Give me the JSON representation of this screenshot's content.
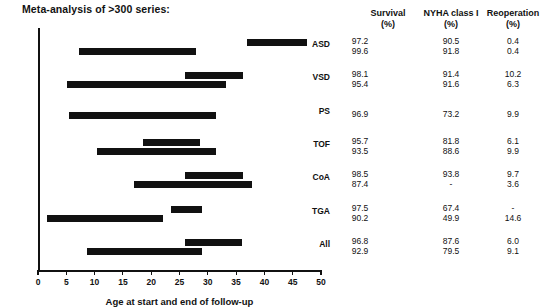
{
  "figure": {
    "title": "Meta-analysis of >300 series:"
  },
  "chart_data": {
    "type": "bar",
    "title": "Meta-analysis of >300 series:",
    "xlabel": "Age at start and end of follow-up",
    "ylabel": "",
    "xlim": [
      0,
      50
    ],
    "xticks": [
      0,
      5,
      10,
      15,
      20,
      25,
      30,
      35,
      40,
      45,
      50
    ],
    "grid": false,
    "legend": null,
    "orientation": "horizontal-range-bars",
    "bar_color": "#111111",
    "categories": [
      "ASD",
      "VSD",
      "PS",
      "TOF",
      "CoA",
      "TGA",
      "All"
    ],
    "groups": [
      {
        "category": "ASD",
        "bars": [
          {
            "start": 37.0,
            "end": 47.5
          },
          {
            "start": 7.2,
            "end": 28.0
          }
        ]
      },
      {
        "category": "VSD",
        "bars": [
          {
            "start": 26.0,
            "end": 36.2
          },
          {
            "start": 5.2,
            "end": 33.2
          }
        ]
      },
      {
        "category": "PS",
        "bars": [
          {
            "start": 5.4,
            "end": 31.5
          }
        ]
      },
      {
        "category": "TOF",
        "bars": [
          {
            "start": 18.6,
            "end": 28.7
          },
          {
            "start": 10.5,
            "end": 31.4
          }
        ]
      },
      {
        "category": "CoA",
        "bars": [
          {
            "start": 26.0,
            "end": 36.3
          },
          {
            "start": 17.0,
            "end": 37.8
          }
        ]
      },
      {
        "category": "TGA",
        "bars": [
          {
            "start": 23.5,
            "end": 29.0
          },
          {
            "start": 1.6,
            "end": 22.0
          }
        ]
      },
      {
        "category": "All",
        "bars": [
          {
            "start": 26.0,
            "end": 36.0
          },
          {
            "start": 8.7,
            "end": 29.0
          }
        ]
      }
    ],
    "table": {
      "columns": [
        "Survival (%)",
        "NYHA class I (%)",
        "Reoperation (%)"
      ],
      "rows": [
        {
          "category": "ASD",
          "survival": [
            "97.2",
            "99.6"
          ],
          "nyha": [
            "90.5",
            "91.8"
          ],
          "reoperation": [
            "0.4",
            "0.4"
          ]
        },
        {
          "category": "VSD",
          "survival": [
            "98.1",
            "95.4"
          ],
          "nyha": [
            "91.4",
            "91.6"
          ],
          "reoperation": [
            "10.2",
            "6.3"
          ]
        },
        {
          "category": "PS",
          "survival": [
            "96.9"
          ],
          "nyha": [
            "73.2"
          ],
          "reoperation": [
            "9.9"
          ]
        },
        {
          "category": "TOF",
          "survival": [
            "95.7",
            "93.5"
          ],
          "nyha": [
            "81.8",
            "88.6"
          ],
          "reoperation": [
            "6.1",
            "9.9"
          ]
        },
        {
          "category": "CoA",
          "survival": [
            "98.5",
            "87.4"
          ],
          "nyha": [
            "93.8",
            "-"
          ],
          "reoperation": [
            "9.7",
            "3.6"
          ]
        },
        {
          "category": "TGA",
          "survival": [
            "97.5",
            "90.2"
          ],
          "nyha": [
            "67.4",
            "49.9"
          ],
          "reoperation": [
            "-",
            "14.6"
          ]
        },
        {
          "category": "All",
          "survival": [
            "96.8",
            "92.9"
          ],
          "nyha": [
            "87.6",
            "79.5"
          ],
          "reoperation": [
            "6.0",
            "9.1"
          ]
        }
      ]
    }
  },
  "table_headers": {
    "survival_name": "Survival",
    "survival_unit": "(%)",
    "nyha_name": "NYHA class I",
    "nyha_unit": "(%)",
    "reoperation_name": "Reoperation",
    "reoperation_unit": "(%)"
  },
  "axis": {
    "x_title": "Age at start and end of follow-up"
  }
}
